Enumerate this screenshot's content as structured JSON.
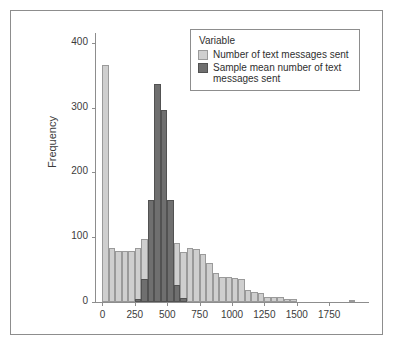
{
  "chart_data": {
    "type": "bar",
    "title": "",
    "subtitle": "",
    "xlabel": "",
    "ylabel": "Frequency",
    "xlim": [
      -50,
      2050
    ],
    "ylim": [
      0,
      415
    ],
    "xticks": [
      0,
      250,
      500,
      750,
      1000,
      1250,
      1500,
      1750
    ],
    "yticks": [
      0,
      100,
      200,
      300,
      400
    ],
    "grid": false,
    "bin_width": 50,
    "legend": {
      "position": "top-right",
      "title": "Variable",
      "entries": [
        {
          "label": "Number of text messages sent",
          "color": "#cfcfcf"
        },
        {
          "label": "Sample mean  number of text messages sent",
          "color": "#6f6f6f"
        }
      ]
    },
    "series": [
      {
        "name": "Number of text messages sent",
        "color": "#cfcfcf",
        "bins": [
          {
            "x0": 0,
            "x1": 50,
            "value": 365
          },
          {
            "x0": 50,
            "x1": 100,
            "value": 83
          },
          {
            "x0": 100,
            "x1": 150,
            "value": 79
          },
          {
            "x0": 150,
            "x1": 200,
            "value": 79
          },
          {
            "x0": 200,
            "x1": 250,
            "value": 78
          },
          {
            "x0": 250,
            "x1": 300,
            "value": 83
          },
          {
            "x0": 300,
            "x1": 350,
            "value": 97
          },
          {
            "x0": 350,
            "x1": 400,
            "value": 92
          },
          {
            "x0": 400,
            "x1": 450,
            "value": 89
          },
          {
            "x0": 450,
            "x1": 500,
            "value": 87
          },
          {
            "x0": 500,
            "x1": 550,
            "value": 94
          },
          {
            "x0": 550,
            "x1": 600,
            "value": 91
          },
          {
            "x0": 600,
            "x1": 650,
            "value": 77
          },
          {
            "x0": 650,
            "x1": 700,
            "value": 84
          },
          {
            "x0": 700,
            "x1": 750,
            "value": 82
          },
          {
            "x0": 750,
            "x1": 800,
            "value": 74
          },
          {
            "x0": 800,
            "x1": 850,
            "value": 60
          },
          {
            "x0": 850,
            "x1": 900,
            "value": 45
          },
          {
            "x0": 900,
            "x1": 950,
            "value": 38
          },
          {
            "x0": 950,
            "x1": 1000,
            "value": 38
          },
          {
            "x0": 1000,
            "x1": 1050,
            "value": 37
          },
          {
            "x0": 1050,
            "x1": 1100,
            "value": 35
          },
          {
            "x0": 1100,
            "x1": 1150,
            "value": 19
          },
          {
            "x0": 1150,
            "x1": 1200,
            "value": 16
          },
          {
            "x0": 1200,
            "x1": 1250,
            "value": 14
          },
          {
            "x0": 1250,
            "x1": 1300,
            "value": 8
          },
          {
            "x0": 1300,
            "x1": 1350,
            "value": 8
          },
          {
            "x0": 1350,
            "x1": 1400,
            "value": 8
          },
          {
            "x0": 1400,
            "x1": 1450,
            "value": 5
          },
          {
            "x0": 1450,
            "x1": 1500,
            "value": 4
          },
          {
            "x0": 1900,
            "x1": 1950,
            "value": 3
          }
        ]
      },
      {
        "name": "Sample mean  number of text messages sent",
        "color": "#6f6f6f",
        "bins": [
          {
            "x0": 250,
            "x1": 300,
            "value": 5
          },
          {
            "x0": 300,
            "x1": 350,
            "value": 36
          },
          {
            "x0": 350,
            "x1": 400,
            "value": 157
          },
          {
            "x0": 400,
            "x1": 450,
            "value": 337
          },
          {
            "x0": 450,
            "x1": 500,
            "value": 297
          },
          {
            "x0": 500,
            "x1": 550,
            "value": 157
          },
          {
            "x0": 550,
            "x1": 600,
            "value": 26
          },
          {
            "x0": 600,
            "x1": 650,
            "value": 6
          }
        ]
      }
    ]
  }
}
